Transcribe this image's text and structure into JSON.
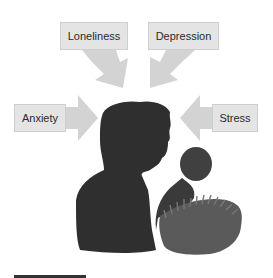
{
  "diagram": {
    "center": "person-silhouette-holding-infant",
    "factors": [
      {
        "label": "Loneliness",
        "direction": "from-top-left"
      },
      {
        "label": "Depression",
        "direction": "from-top-right"
      },
      {
        "label": "Anxiety",
        "direction": "from-left"
      },
      {
        "label": "Stress",
        "direction": "from-right"
      }
    ]
  },
  "colors": {
    "box_fill": "#e4e4e4",
    "arrow_fill": "#d0d0d0",
    "silhouette": "#2e2e2e",
    "infant": "#4a4a4a"
  }
}
